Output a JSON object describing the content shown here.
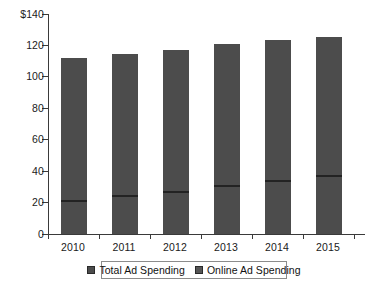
{
  "chart_data": {
    "type": "bar",
    "title": "",
    "subtitle": "",
    "xlabel": "",
    "ylabel": "",
    "categories": [
      "2010",
      "2011",
      "2012",
      "2013",
      "2014",
      "2015"
    ],
    "series": [
      {
        "name": "Total Ad Spending",
        "values": [
          112,
          114.5,
          117,
          121,
          123.5,
          125.5
        ]
      },
      {
        "name": "Online Ad Spending",
        "values": [
          21,
          24,
          27,
          30.5,
          34,
          37
        ]
      }
    ],
    "ylim": [
      0,
      140
    ],
    "yticks": [
      0,
      20,
      40,
      60,
      80,
      100,
      120,
      140
    ],
    "ytick_labels": [
      "0",
      "20",
      "40",
      "60",
      "80",
      "100",
      "120",
      "$140"
    ],
    "grid": false,
    "legend_position": "bottom",
    "colors": {
      "total_bar": "#4c4c4c",
      "online_marker": "#232323",
      "axis": "#3a3a3a",
      "background": "#ffffff",
      "text": "#1a1a1a"
    }
  },
  "axis": {
    "y_labels": [
      "$140",
      "120",
      "100",
      "80",
      "60",
      "40",
      "20",
      "0"
    ],
    "x_labels": [
      "2010",
      "2011",
      "2012",
      "2013",
      "2014",
      "2015"
    ]
  },
  "legend": {
    "items": [
      {
        "label": "Total Ad Spending",
        "swatch": "total-swatch"
      },
      {
        "label": "Online Ad Spending",
        "swatch": "online-swatch"
      }
    ]
  }
}
